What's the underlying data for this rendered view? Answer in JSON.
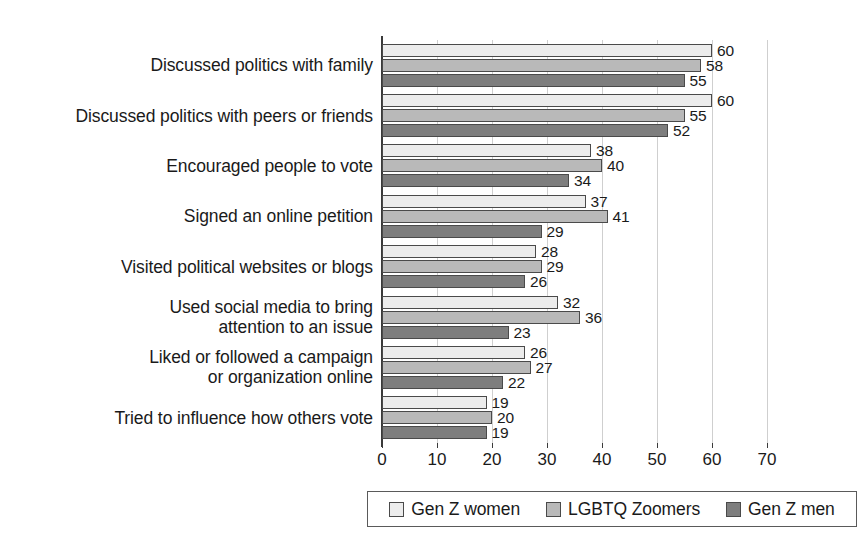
{
  "chart_data": {
    "type": "bar",
    "orientation": "horizontal",
    "title": "",
    "subtitle": "",
    "xlabel": "",
    "ylabel": "",
    "xlim": [
      0,
      70
    ],
    "xticks": [
      "0",
      "10",
      "20",
      "30",
      "40",
      "50",
      "60",
      "70"
    ],
    "grid": "vertical",
    "legend_position": "bottom",
    "show_data_labels": true,
    "categories": [
      "Discussed politics with family",
      "Discussed politics with peers or friends",
      "Encouraged people to vote",
      "Signed an online petition",
      "Visited political websites or blogs",
      "Used social media to bring\nattention to an issue",
      "Liked or followed a campaign\nor organization online",
      "Tried to influence how others vote"
    ],
    "series": [
      {
        "name": "Gen Z women",
        "color": "#ececec",
        "swatch_name": "legend-swatch-gen-z-women",
        "values": [
          60,
          60,
          38,
          37,
          28,
          32,
          26,
          19
        ]
      },
      {
        "name": "LGBTQ Zoomers",
        "color": "#b9b9b9",
        "swatch_name": "legend-swatch-lgbtq-zoomers",
        "values": [
          58,
          55,
          40,
          41,
          29,
          36,
          27,
          20
        ]
      },
      {
        "name": "Gen Z men",
        "color": "#7e7e7e",
        "swatch_name": "legend-swatch-gen-z-men",
        "values": [
          55,
          52,
          34,
          29,
          26,
          23,
          22,
          19
        ]
      }
    ]
  },
  "legend": {
    "items": [
      {
        "label": "Gen Z women",
        "color": "#ececec"
      },
      {
        "label": "LGBTQ Zoomers",
        "color": "#b9b9b9"
      },
      {
        "label": "Gen Z men",
        "color": "#7e7e7e"
      }
    ]
  },
  "axis": {
    "x_tick_labels": [
      "0",
      "10",
      "20",
      "30",
      "40",
      "50",
      "60",
      "70"
    ],
    "x_min": 0,
    "x_max": 70
  }
}
